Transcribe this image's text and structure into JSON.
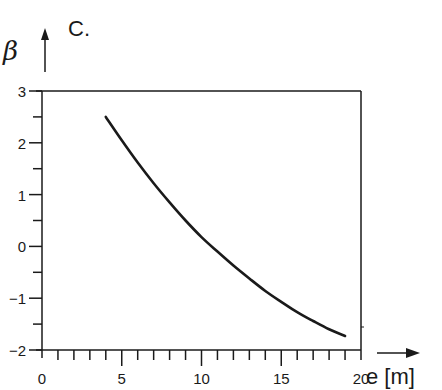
{
  "chart_data": {
    "type": "line",
    "title": "C.",
    "xlabel": "e [m]",
    "ylabel": "β",
    "xlim": [
      0,
      20
    ],
    "ylim": [
      -2,
      3
    ],
    "x_ticks": [
      "0",
      "5",
      "10",
      "15",
      "20"
    ],
    "y_ticks": [
      "3",
      "2",
      "1",
      "0",
      "-1",
      "-2"
    ],
    "x_minor_step": 1,
    "y_minor_step": 0.5,
    "grid": false,
    "legend": null,
    "series": [
      {
        "name": "β(e)",
        "x": [
          4,
          5,
          6,
          7,
          8,
          9,
          10,
          11,
          12,
          13,
          14,
          15,
          16,
          17,
          18,
          19
        ],
        "values": [
          2.5,
          2.05,
          1.62,
          1.22,
          0.85,
          0.5,
          0.18,
          -0.1,
          -0.37,
          -0.62,
          -0.86,
          -1.07,
          -1.27,
          -1.44,
          -1.6,
          -1.73
        ]
      }
    ],
    "color": "#1a1a1a"
  }
}
